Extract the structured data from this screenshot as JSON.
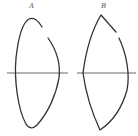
{
  "figure": {
    "panels": [
      {
        "id": "A",
        "label": "A",
        "shape": "rounded oval with gap on upper-right side",
        "has_axis_line": true
      },
      {
        "id": "B",
        "label": "B",
        "shape": "lens/pointed oval with gap on upper-right side",
        "has_axis_line": true
      }
    ],
    "colors": {
      "stroke": "#333333",
      "axis": "#555555",
      "background": "#ffffff"
    }
  }
}
